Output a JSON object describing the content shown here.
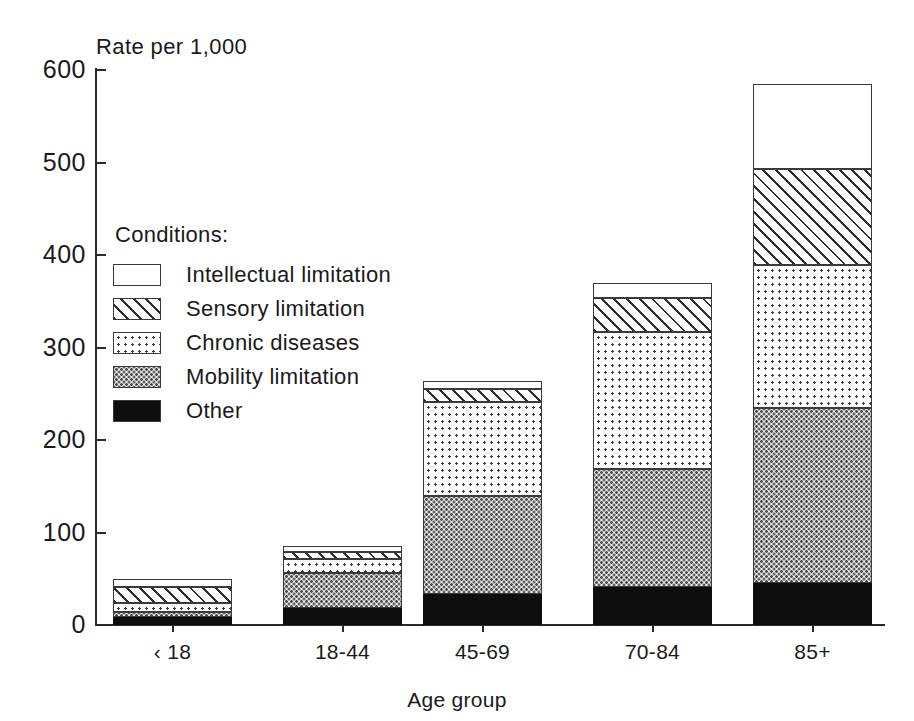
{
  "chart_data": {
    "type": "bar",
    "subtype": "stacked",
    "title": "",
    "xlabel": "Age group",
    "ylabel": "Rate per 1,000",
    "ylim": [
      0,
      600
    ],
    "yticks": [
      0,
      100,
      200,
      300,
      400,
      500,
      600
    ],
    "ytick_labels": [
      "0",
      "100",
      "200",
      "300",
      "400",
      "500",
      "600"
    ],
    "grid": false,
    "legend_position": "inside-upper-left",
    "legend_title": "Conditions:",
    "categories": [
      "< 18",
      "18-44",
      "45-69",
      "70-84",
      "85+"
    ],
    "stack_order_bottom_to_top": [
      "Other",
      "Mobility limitation",
      "Chronic diseases",
      "Sensory limitation",
      "Intellectual limitation"
    ],
    "series": [
      {
        "name": "Other",
        "pattern": "solid-black",
        "values": [
          9,
          18,
          34,
          41,
          45
        ]
      },
      {
        "name": "Mobility limitation",
        "pattern": "dense-dots",
        "values": [
          5,
          38,
          105,
          128,
          190
        ]
      },
      {
        "name": "Chronic diseases",
        "pattern": "fine-dots",
        "values": [
          10,
          15,
          102,
          148,
          154
        ]
      },
      {
        "name": "Sensory limitation",
        "pattern": "diagonal-hatch",
        "values": [
          17,
          8,
          14,
          36,
          104
        ]
      },
      {
        "name": "Intellectual limitation",
        "pattern": "white",
        "values": [
          9,
          6,
          9,
          17,
          92
        ]
      }
    ],
    "totals": [
      50,
      85,
      264,
      370,
      585
    ]
  },
  "axes": {
    "y_title": "Rate per 1,000",
    "x_title": "Age group",
    "y_tick_labels": [
      "600",
      "500",
      "400",
      "300",
      "200",
      "100",
      "0"
    ],
    "x_tick_labels": [
      "‹ 18",
      "18-44",
      "45-69",
      "70-84",
      "85+"
    ]
  },
  "legend": {
    "title": "Conditions:",
    "items": [
      {
        "label": "Intellectual limitation",
        "pattern": "white"
      },
      {
        "label": "Sensory limitation",
        "pattern": "diagonal-hatch"
      },
      {
        "label": "Chronic diseases",
        "pattern": "fine-dots"
      },
      {
        "label": "Mobility limitation",
        "pattern": "dense-dots"
      },
      {
        "label": "Other",
        "pattern": "solid-black"
      }
    ]
  },
  "colors": {
    "ink": "#2b2b2b",
    "background": "#ffffff",
    "solid_black": "#0d0d0d"
  }
}
